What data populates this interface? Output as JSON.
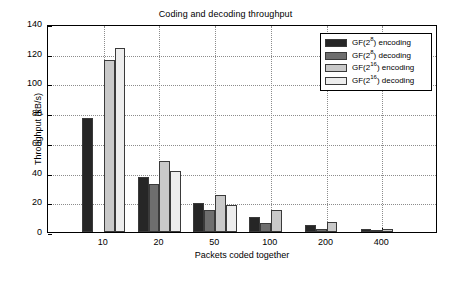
{
  "chart_data": {
    "type": "bar",
    "title": "Coding and decoding throughput",
    "xlabel": "Packets coded together",
    "ylabel": "Throughput (kB/s)",
    "categories": [
      "10",
      "20",
      "50",
      "100",
      "200",
      "400"
    ],
    "ylim": [
      0,
      140
    ],
    "yticks": [
      0,
      20,
      40,
      60,
      80,
      100,
      120,
      140
    ],
    "grid": true,
    "legend_position": "top-right",
    "series": [
      {
        "name": "GF(2^8) encoding",
        "label_base": "GF(2",
        "label_sup": "8",
        "label_tail": ") encoding",
        "color": "#262626",
        "values": [
          77,
          37,
          19.5,
          10,
          4.5,
          2
        ]
      },
      {
        "name": "GF(2^8) decoding",
        "label_base": "GF(2",
        "label_sup": "8",
        "label_tail": ") decoding",
        "color": "#6e6e6e",
        "values": [
          0,
          32,
          15,
          6,
          2,
          0.8
        ]
      },
      {
        "name": "GF(2^16) encoding",
        "label_base": "GF(2",
        "label_sup": "16",
        "label_tail": ") encoding",
        "color": "#c9c9c9",
        "values": [
          116,
          48,
          25,
          14.5,
          6.5,
          2
        ]
      },
      {
        "name": "GF(2^16) decoding",
        "label_base": "GF(2",
        "label_sup": "16",
        "label_tail": ") decoding",
        "color": "#ededed",
        "values": [
          124,
          41,
          18.5,
          0,
          0,
          0
        ]
      }
    ]
  }
}
